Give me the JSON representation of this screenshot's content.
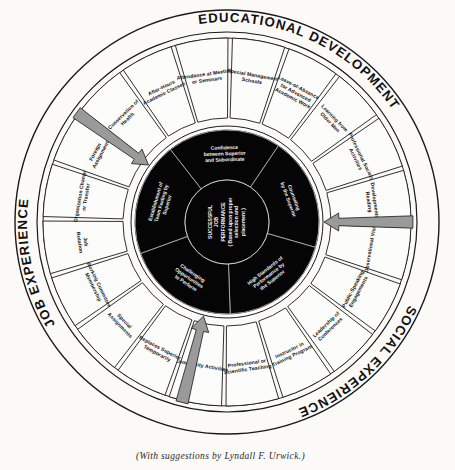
{
  "caption": "(With suggestions by Lyndall F. Urwick.)",
  "colors": {
    "paper": "#fbfaf7",
    "ink": "#1a1a1a",
    "core_black": "#050505",
    "arrow_gray": "#9a9a9a",
    "segment_white": "#fcfcfa"
  },
  "bands": [
    {
      "id": "educational-development",
      "label": "EDUCATIONAL DEVELOPMENT",
      "start_deg": -122,
      "end_deg": -10
    },
    {
      "id": "social-experience",
      "label": "SOCIAL EXPERIENCE",
      "start_deg": -2,
      "end_deg": 96
    },
    {
      "id": "job-experience",
      "label": "JOB EXPERIENCE",
      "start_deg": 104,
      "end_deg": 232
    }
  ],
  "center": {
    "id": "successful-job-performance",
    "lines": [
      "SUCCESSFUL",
      "JOB",
      "PERFORMANCE",
      "( Based upon proper",
      "selection and",
      "placement )"
    ]
  },
  "core_segments": [
    {
      "id": "confidence-superior-subordinate",
      "lines": [
        "Confidence",
        "between Superior",
        "and Subordinate"
      ]
    },
    {
      "id": "counseling-by-superior",
      "lines": [
        "Counseling",
        "by the Superior"
      ]
    },
    {
      "id": "high-standards-performance",
      "lines": [
        "High Standards of",
        "Performance by",
        "the Superior"
      ]
    },
    {
      "id": "challenging-opportunities",
      "lines": [
        "Challenging",
        "Opportunities",
        "to Perform"
      ]
    },
    {
      "id": "establishment-team-feeling",
      "lines": [
        "Establishment of",
        "Team Feeling by",
        "Superior"
      ]
    }
  ],
  "spokes": [
    {
      "id": "after-hours-academic-classes",
      "group": "educational-development",
      "lines": [
        "After-Hours",
        "Academic Classes"
      ]
    },
    {
      "id": "attendance-meetings-seminars",
      "group": "educational-development",
      "lines": [
        "Attendance at Meetings",
        "or Seminars"
      ]
    },
    {
      "id": "special-management-schools",
      "group": "educational-development",
      "lines": [
        "Special Management",
        "Schools"
      ]
    },
    {
      "id": "leave-of-absence-advanced-academic-work",
      "group": "educational-development",
      "lines": [
        "Leave-of-Absence",
        "for Advanced",
        "Academic Work"
      ]
    },
    {
      "id": "learning-from-older-men",
      "group": "educational-development",
      "lines": [
        "Learning from",
        "Older Men"
      ]
    },
    {
      "id": "professional-society-activities",
      "group": "educational-development",
      "lines": [
        "Professional Society",
        "Activities"
      ]
    },
    {
      "id": "developmental-reading",
      "group": "educational-development",
      "lines": [
        "Developmental",
        "Reading"
      ]
    },
    {
      "id": "observational-visits",
      "group": "educational-development",
      "lines": [
        "Observational Visits"
      ]
    },
    {
      "id": "public-speaking-engagements",
      "group": "social-experience",
      "lines": [
        "Public-Speaking",
        "Engagements"
      ]
    },
    {
      "id": "leadership-of-conferences",
      "group": "social-experience",
      "lines": [
        "Leadership of",
        "Conferences"
      ]
    },
    {
      "id": "instructor-in-training-program",
      "group": "social-experience",
      "lines": [
        "Instructor in",
        "Training Program"
      ]
    },
    {
      "id": "professional-scientific-teaching",
      "group": "social-experience",
      "lines": [
        "Professional or",
        "Scientific Teaching"
      ]
    },
    {
      "id": "community-activities",
      "group": "social-experience",
      "lines": [
        "Community Activities"
      ]
    },
    {
      "id": "replaces-superior-temporarily",
      "group": "job-experience",
      "lines": [
        "Replaces Superior",
        "Temporarily"
      ]
    },
    {
      "id": "special-assignments",
      "group": "job-experience",
      "lines": [
        "Special",
        "Assignments"
      ]
    },
    {
      "id": "working-committee-membership",
      "group": "job-experience",
      "lines": [
        "Working Committee",
        "Membership"
      ]
    },
    {
      "id": "job-rotation",
      "group": "job-experience",
      "lines": [
        "Job",
        "Rotation"
      ]
    },
    {
      "id": "organization-change-or-transfer",
      "group": "job-experience",
      "lines": [
        "Organization Change",
        "or Transfer"
      ]
    },
    {
      "id": "foreign-assignment",
      "group": "job-experience",
      "lines": [
        "Foreign",
        "Assignment"
      ]
    },
    {
      "id": "conservation-of-health",
      "group": "job-experience",
      "lines": [
        "Conservation of",
        "Health"
      ]
    }
  ],
  "arrows": [
    {
      "id": "arrow-upper-left",
      "angle_deg": 216
    },
    {
      "id": "arrow-right",
      "angle_deg": 0
    },
    {
      "id": "arrow-bottom",
      "angle_deg": 104
    }
  ]
}
